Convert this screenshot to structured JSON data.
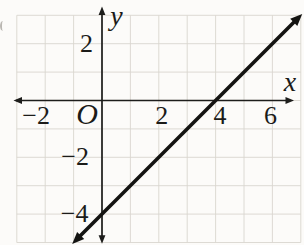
{
  "figure": {
    "background_color": "#fcfbf9",
    "grid_color": "#d9d6cf",
    "axis_color": "#1d1d1b",
    "line_color": "#141412",
    "text_color": "#1b1b19"
  },
  "chart_data": {
    "type": "line",
    "xlabel": "x",
    "ylabel": "y",
    "origin_label": "O",
    "xlim": [
      -3,
      7
    ],
    "ylim": [
      -5,
      3
    ],
    "grid": true,
    "grid_step": 1,
    "axes_arrows_both_ends": true,
    "x_tick_labels": [
      {
        "value": -2,
        "label": "−2"
      },
      {
        "value": 2,
        "label": "2"
      },
      {
        "value": 4,
        "label": "4"
      },
      {
        "value": 6,
        "label": "6"
      }
    ],
    "y_tick_labels": [
      {
        "value": 2,
        "label": "2"
      },
      {
        "value": -2,
        "label": "−2"
      },
      {
        "value": -4,
        "label": "−4"
      }
    ],
    "series": [
      {
        "name": "line-y-equals-x-minus-4",
        "equation": "y = x − 4",
        "slope": 1,
        "x_intercept": 4,
        "y_intercept": -4,
        "arrows_both_ends": true,
        "points": [
          [
            -1.05,
            -5.05
          ],
          [
            0,
            -4
          ],
          [
            2,
            -2
          ],
          [
            4,
            0
          ],
          [
            6,
            2
          ],
          [
            7.05,
            3.05
          ]
        ]
      }
    ]
  }
}
